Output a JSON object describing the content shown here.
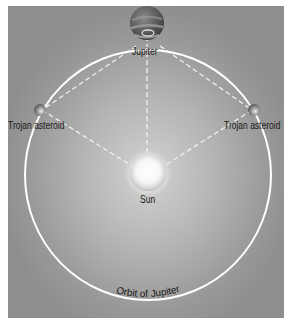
{
  "diagram": {
    "labels": {
      "jupiter": "Jupiter",
      "trojan_left": "Trojan asteroid",
      "trojan_right": "Trojan asteroid",
      "sun": "Sun",
      "orbit": "Orbit of Jupiter"
    },
    "colors": {
      "background_center": "#d2d2d2",
      "background_edge": "#8e8e8e",
      "orbit_line": "#ffffff",
      "dashed_line": "#f0f0f0",
      "label_text": "#1a1a1a"
    }
  }
}
